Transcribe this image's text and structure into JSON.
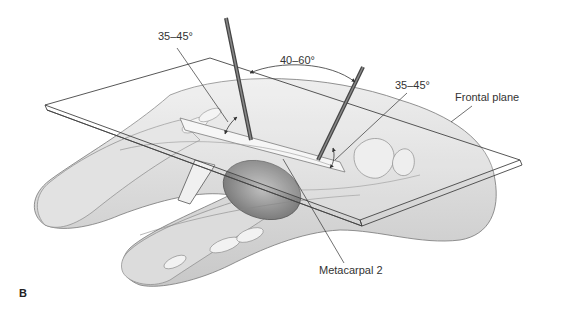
{
  "figure": {
    "panel_letter": "B",
    "labels": {
      "angle_left": "35–45°",
      "angle_top": "40–60°",
      "angle_right": "35–45°",
      "frontal_plane": "Frontal plane",
      "metacarpal": "Metacarpal 2"
    },
    "colors": {
      "ink": "#333333",
      "skin": "#d8d8d8",
      "shadow": "#a8a8a8",
      "pin": "#555555",
      "background": "#ffffff"
    }
  }
}
